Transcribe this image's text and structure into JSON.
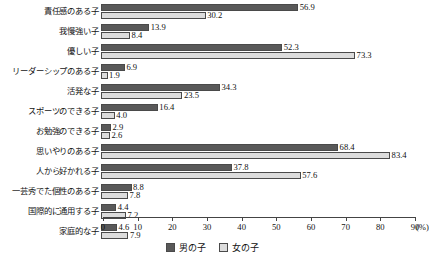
{
  "chart_data": {
    "type": "bar",
    "orientation": "horizontal",
    "title": "",
    "xlabel": "(%)",
    "ylabel": "",
    "xlim": [
      0,
      90
    ],
    "xticks": [
      0,
      10,
      20,
      30,
      40,
      50,
      60,
      70,
      80,
      90
    ],
    "grid": false,
    "legend_position": "bottom-center",
    "categories": [
      "責任感のある子",
      "我慢強い子",
      "優しい子",
      "リーダーシップのある子",
      "活発な子",
      "スポーツのできる子",
      "お勉強のできる子",
      "思いやりのある子",
      "人から好かれる子",
      "一芸秀でた個性のある子",
      "国際的に通用する子",
      "家庭的な子"
    ],
    "series": [
      {
        "name": "男の子",
        "color": "#595959",
        "values": [
          56.9,
          13.9,
          52.3,
          6.9,
          34.3,
          16.4,
          2.9,
          68.4,
          37.8,
          8.8,
          4.4,
          4.6
        ]
      },
      {
        "name": "女の子",
        "color": "#dcdcdc",
        "values": [
          30.2,
          8.4,
          73.3,
          1.9,
          23.5,
          4.0,
          2.6,
          83.4,
          57.6,
          7.8,
          7.2,
          7.9
        ]
      }
    ]
  },
  "axis": {
    "unit_label": "(%)",
    "tick_labels": [
      "0",
      "10",
      "20",
      "30",
      "40",
      "50",
      "60",
      "70",
      "80",
      "90"
    ]
  },
  "legend": {
    "items": [
      {
        "label": "男の子"
      },
      {
        "label": "女の子"
      }
    ]
  }
}
